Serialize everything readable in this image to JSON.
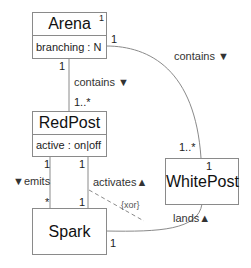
{
  "classes": {
    "arena": {
      "name": "Arena",
      "attribute": "branching : N",
      "corner_mult": "1"
    },
    "redpost": {
      "name": "RedPost",
      "attribute": "active : on|off"
    },
    "whitepost": {
      "name": "WhitePost"
    },
    "spark": {
      "name": "Spark"
    }
  },
  "associations": {
    "arena_redpost": {
      "label": "contains ▼",
      "mult_arena": "1",
      "mult_redpost": "1..*"
    },
    "arena_whitepost": {
      "label": "contains ▼",
      "mult_arena": "1",
      "mult_whitepost": "1..*"
    },
    "redpost_spark_emits": {
      "label": "▼emits",
      "mult_redpost": "1",
      "mult_spark": "*"
    },
    "redpost_spark_activates": {
      "label": "activates▲",
      "mult_redpost": "1",
      "mult_spark": "1"
    },
    "whitepost_spark_lands": {
      "label": "lands▲",
      "mult_whitepost": "1",
      "mult_spark": "1"
    },
    "constraint": "{xor}"
  },
  "colors": {
    "line": "#8a8a8a",
    "text": "#222222"
  }
}
